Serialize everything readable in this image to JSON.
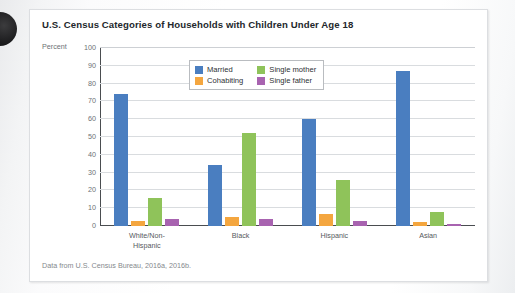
{
  "figure": {
    "title": "U.S. Census Categories of Households with Children Under Age 18",
    "source_note": "Data from U.S. Census Bureau, 2016a, 2016b."
  },
  "chart_data": {
    "type": "bar",
    "title": "U.S. Census Categories of Households with Children Under Age 18",
    "xlabel": "",
    "ylabel": "Percent",
    "ylim": [
      0,
      100
    ],
    "yticks": [
      0,
      10,
      20,
      30,
      40,
      50,
      60,
      70,
      80,
      90,
      100
    ],
    "grid": true,
    "legend_position": "top-center",
    "categories": [
      "White/Non-\nHispanic",
      "Black",
      "Hispanic",
      "Asian"
    ],
    "series": [
      {
        "name": "Married",
        "color": "#4a7ec0",
        "values": [
          74,
          34,
          60,
          87
        ]
      },
      {
        "name": "Cohabiting",
        "color": "#f4a63f",
        "values": [
          3,
          5,
          7,
          2
        ]
      },
      {
        "name": "Single mother",
        "color": "#8fc35a",
        "values": [
          16,
          52,
          26,
          8
        ]
      },
      {
        "name": "Single father",
        "color": "#a863b0",
        "values": [
          4,
          4,
          3,
          1
        ]
      }
    ]
  }
}
